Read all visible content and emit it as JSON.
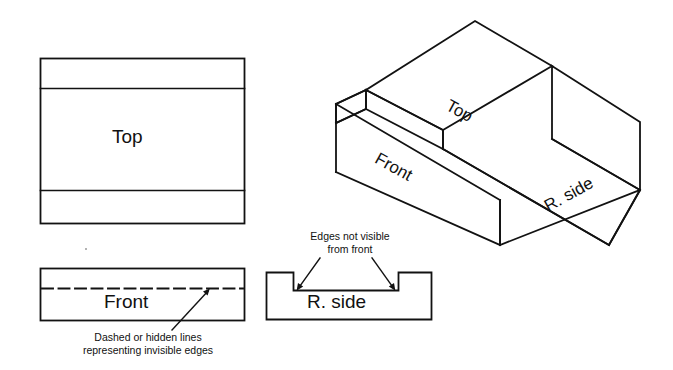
{
  "figure": {
    "kind": "engineering-drawing",
    "stroke_color": "#121212",
    "background_color": "#ffffff"
  },
  "orthographic": {
    "top_view": {
      "label": "Top",
      "rect": {
        "x": 40,
        "y": 58,
        "width": 204,
        "height": 165
      },
      "interior_lines_y": [
        88,
        190
      ]
    },
    "front_view": {
      "label": "Front",
      "rect": {
        "x": 40,
        "y": 268,
        "width": 204,
        "height": 52
      },
      "hidden_line_y": 288,
      "hidden_line_style": "dashed"
    },
    "right_side_view": {
      "label": "R. side",
      "outline_points": "266,272 293,272 293,290 399,290 399,272 432,272 432,320 266,320",
      "notch_floor_y": 290,
      "notch_left_x": 293,
      "notch_right_x": 399
    }
  },
  "annotations": {
    "hidden_lines_caption": {
      "line1": "Dashed or hidden lines",
      "line2": "representing invisible edges",
      "leader_from": {
        "x": 174,
        "y": 330
      },
      "leader_to": {
        "x": 210,
        "y": 290
      }
    },
    "edges_caption": {
      "line1": "Edges not visible",
      "line2": "from front",
      "arrow_left_to": {
        "x": 296,
        "y": 290
      },
      "arrow_right_to": {
        "x": 396,
        "y": 290
      }
    }
  },
  "isometric": {
    "labels": {
      "top": "Top",
      "front": "Front",
      "right_side": "R. side"
    },
    "shape": "U-channel block with a rectangular groove running front-to-back",
    "vertices": {
      "rear_ridge_apex": {
        "x": 475,
        "y": 21
      },
      "left_ridge_top": {
        "x": 366,
        "y": 90
      },
      "right_corner_top": {
        "x": 640,
        "y": 122
      },
      "front_bottom_corner": {
        "x": 500,
        "y": 245
      }
    }
  }
}
